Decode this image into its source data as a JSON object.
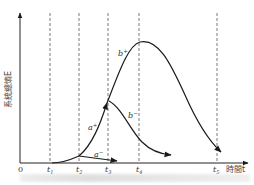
{
  "diagram": {
    "y_axis_label": "系統總熵E",
    "x_axis_label": "時間t",
    "origin_label": "0",
    "time_marks": [
      {
        "label": "t",
        "sub": "1",
        "x": 50
      },
      {
        "label": "t",
        "sub": "2",
        "x": 79
      },
      {
        "label": "t",
        "sub": "3",
        "x": 108
      },
      {
        "label": "t",
        "sub": "4",
        "x": 139
      },
      {
        "label": "t",
        "sub": "5",
        "x": 217
      }
    ],
    "curves": [
      {
        "name": "a-",
        "label": "a",
        "sup": "−"
      },
      {
        "name": "a+",
        "label": "a",
        "sup": "+"
      },
      {
        "name": "b-",
        "label": "b",
        "sup": "−"
      },
      {
        "name": "b+",
        "label": "b",
        "sup": "+"
      }
    ],
    "colors": {
      "line": "#1a1a1a",
      "dashed": "#555555",
      "axis": "#222222"
    },
    "caption": "(illegible caption)"
  }
}
